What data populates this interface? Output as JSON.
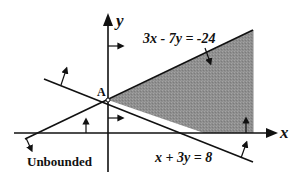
{
  "diagram": {
    "type": "linear-inequality-feasible-region",
    "axes": {
      "x_label": "x",
      "y_label": "y"
    },
    "constraints": [
      {
        "equation": "3x - 7y = -24",
        "label": "3x - 7y = -24"
      },
      {
        "equation": "x + 3y = 8",
        "label": "x + 3y = 8"
      }
    ],
    "point_label": "A",
    "region_note": "Unbounded",
    "colors": {
      "shade": "#8f8f8f",
      "line": "#111111"
    }
  }
}
